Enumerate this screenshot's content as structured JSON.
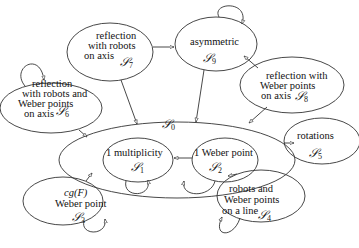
{
  "diagram": {
    "type": "state-transition-graph",
    "nodes": [
      {
        "id": "S0",
        "symbol": "𝒮",
        "index": "0",
        "label": ""
      },
      {
        "id": "S1",
        "symbol": "𝒮",
        "index": "1",
        "label": "1 multiplicity"
      },
      {
        "id": "S2",
        "symbol": "𝒮",
        "index": "2",
        "label": "1 Weber point"
      },
      {
        "id": "S3",
        "symbol": "𝒮",
        "index": "3",
        "label_line1": "cg(F)",
        "label_line2": "Weber point"
      },
      {
        "id": "S4",
        "symbol": "𝒮",
        "index": "4",
        "label_line1": "robots and",
        "label_line2": "Weber points",
        "label_line3": "on a line"
      },
      {
        "id": "S5",
        "symbol": "𝒮",
        "index": "5",
        "label": "rotations"
      },
      {
        "id": "S6",
        "symbol": "𝒮",
        "index": "6",
        "label_line1": "reflection",
        "label_line2": "with robots and",
        "label_line3": "Weber points",
        "label_line4": "on axis"
      },
      {
        "id": "S7",
        "symbol": "𝒮",
        "index": "7",
        "label_line1": "reflection",
        "label_line2": "with robots",
        "label_line3": "on axis"
      },
      {
        "id": "S8",
        "symbol": "𝒮",
        "index": "8",
        "label_line1": "reflection with",
        "label_line2": "Weber points",
        "label_line3": "on axis"
      },
      {
        "id": "S9",
        "symbol": "𝒮",
        "index": "9",
        "label": "asymmetric"
      }
    ],
    "edges": [
      {
        "from": "S2",
        "to": "S1"
      },
      {
        "from": "S1",
        "to": "S1",
        "self_loop": true
      },
      {
        "from": "S2",
        "to": "S2",
        "self_loop": true
      },
      {
        "from": "S3",
        "to": "S3",
        "self_loop": true
      },
      {
        "from": "S4",
        "to": "S4",
        "self_loop": true
      },
      {
        "from": "S6",
        "to": "S6",
        "self_loop": true
      },
      {
        "from": "S9",
        "to": "S9",
        "self_loop": true
      },
      {
        "from": "S3",
        "to": "S0"
      },
      {
        "from": "S4",
        "to": "S0"
      },
      {
        "from": "S5",
        "to": "S0"
      },
      {
        "from": "S6",
        "to": "S0"
      },
      {
        "from": "S7",
        "to": "S0"
      },
      {
        "from": "S7",
        "to": "S9"
      },
      {
        "from": "S8",
        "to": "S9"
      },
      {
        "from": "S8",
        "to": "S0"
      },
      {
        "from": "S9",
        "to": "S0"
      }
    ]
  }
}
